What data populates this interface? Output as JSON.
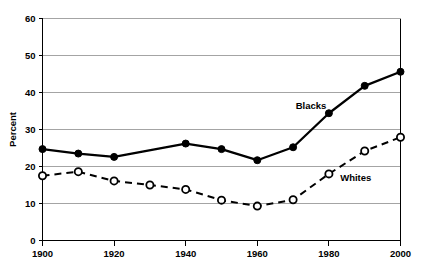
{
  "chart_data": {
    "type": "line",
    "title": "",
    "xlabel": "",
    "ylabel": "Percent",
    "x": [
      1900,
      1910,
      1920,
      1930,
      1940,
      1950,
      1960,
      1970,
      1980,
      1990,
      2000
    ],
    "xlim": [
      1900,
      2000
    ],
    "ylim": [
      0,
      60
    ],
    "xticks": [
      1900,
      1920,
      1940,
      1960,
      1980,
      2000
    ],
    "xtick_labels": [
      "1900",
      "1920",
      "1940",
      "1960",
      "1980",
      "2000"
    ],
    "yticks": [
      0,
      10,
      20,
      30,
      40,
      50,
      60
    ],
    "ytick_labels": [
      "0",
      "10",
      "20",
      "30",
      "40",
      "50",
      "60"
    ],
    "grid": "horizontal",
    "legend": "inline-annotations",
    "series": [
      {
        "name": "Blacks",
        "marker": "filled-circle",
        "line_style": "solid",
        "color": "#000000",
        "x": [
          1900,
          1910,
          1920,
          1940,
          1950,
          1960,
          1970,
          1980,
          1990,
          2000
        ],
        "values": [
          24.7,
          23.5,
          22.6,
          26.2,
          24.7,
          21.7,
          25.2,
          34.4,
          41.8,
          45.6
        ],
        "label_text": "Blacks"
      },
      {
        "name": "Whites",
        "marker": "open-circle",
        "line_style": "dashed",
        "color": "#000000",
        "x": [
          1900,
          1910,
          1920,
          1930,
          1940,
          1950,
          1960,
          1970,
          1980,
          1990,
          2000
        ],
        "values": [
          17.5,
          18.6,
          16.1,
          15.0,
          13.8,
          10.9,
          9.3,
          11.0,
          18.0,
          24.2,
          27.9
        ],
        "label_text": "Whites"
      }
    ]
  },
  "annotations": {
    "blacks_label": "Blacks",
    "whites_label": "Whites"
  },
  "axes": {
    "y_title": "Percent"
  }
}
